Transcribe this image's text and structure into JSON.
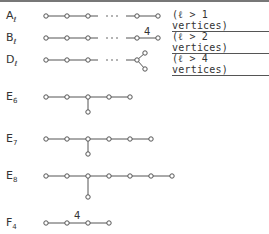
{
  "diagram": {
    "rows": [
      {
        "id": "A",
        "name": "A",
        "subscript": "ℓ",
        "note": "(ℓ > 1 vertices)",
        "y": 16
      },
      {
        "id": "B",
        "name": "B",
        "subscript": "ℓ",
        "note": "(ℓ > 2 vertices)",
        "y": 38,
        "edge_label": "4"
      },
      {
        "id": "D",
        "name": "D",
        "subscript": "ℓ",
        "note": "(ℓ > 4 vertices)",
        "y": 60
      },
      {
        "id": "E6",
        "name": "E",
        "subscript": "6",
        "y": 97
      },
      {
        "id": "E7",
        "name": "E",
        "subscript": "7",
        "y": 139
      },
      {
        "id": "E8",
        "name": "E",
        "subscript": "8",
        "y": 176
      },
      {
        "id": "F4",
        "name": "F",
        "subscript": "4",
        "y": 223,
        "edge_label": "4"
      }
    ],
    "ellipsis": "· · ·",
    "stroke_color": "#555555",
    "text_color": "#333333"
  }
}
